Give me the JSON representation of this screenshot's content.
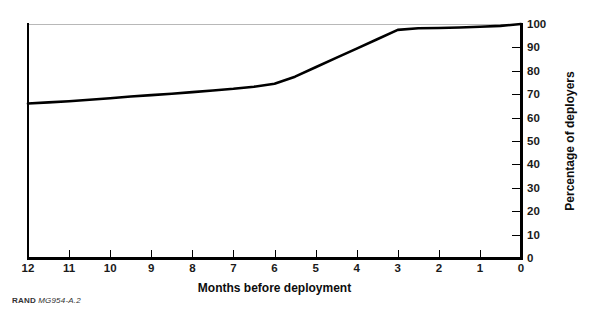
{
  "figure": {
    "footer_brand": "RAND",
    "footer_id": "MG954-A.2"
  },
  "chart_data": {
    "type": "line",
    "title": "",
    "subtitle": "",
    "xlabel": "Months before deployment",
    "ylabel": "Percentage of deployers",
    "xlim": [
      12,
      0
    ],
    "ylim": [
      0,
      100
    ],
    "x_axis_reversed": true,
    "grid": false,
    "legend": null,
    "xticks": [
      12,
      11,
      10,
      9,
      8,
      7,
      6,
      5,
      4,
      3,
      2,
      1,
      0
    ],
    "xticklabels": [
      "12",
      "11",
      "10",
      "9",
      "8",
      "7",
      "6",
      "5",
      "4",
      "3",
      "2",
      "1",
      "0"
    ],
    "yticks": [
      0,
      10,
      20,
      30,
      40,
      50,
      60,
      70,
      80,
      90,
      100
    ],
    "yticklabels": [
      "0",
      "10",
      "20",
      "30",
      "40",
      "50",
      "60",
      "70",
      "80",
      "90",
      "100"
    ],
    "series": [
      {
        "name": "Cumulative percentage of deployers",
        "color": "#000000",
        "linewidth": 2.6,
        "x": [
          12,
          11.5,
          11,
          10.5,
          10,
          9.5,
          9,
          8.5,
          8,
          7.5,
          7,
          6.5,
          6,
          5.5,
          5,
          4.5,
          4,
          3.5,
          3,
          2.5,
          2,
          1.5,
          1,
          0.5,
          0
        ],
        "values": [
          66,
          66.5,
          67,
          67.6,
          68.3,
          69,
          69.6,
          70.2,
          70.9,
          71.6,
          72.3,
          73.2,
          74.5,
          77.5,
          81.5,
          85.5,
          89.5,
          93.5,
          97.5,
          98.2,
          98.3,
          98.5,
          98.8,
          99.2,
          100
        ]
      }
    ],
    "annotations": []
  }
}
